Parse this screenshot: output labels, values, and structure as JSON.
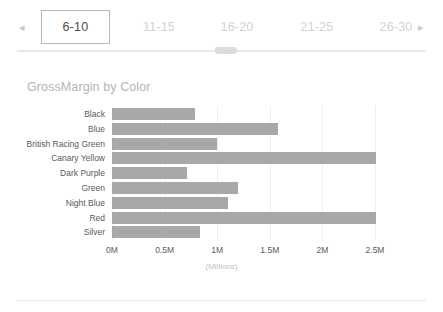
{
  "pager": {
    "prev_label": "◂",
    "next_label": "▸",
    "tabs": [
      {
        "label": "6-10",
        "active": true
      },
      {
        "label": "11-15",
        "active": false
      },
      {
        "label": "16-20",
        "active": false
      },
      {
        "label": "21-25",
        "active": false
      },
      {
        "label": "26-30",
        "active": false
      }
    ]
  },
  "chart_data": {
    "type": "bar",
    "orientation": "horizontal",
    "title": "GrossMargin by Color",
    "xlabel": "(Millions)",
    "ylabel": "",
    "categories": [
      "Black",
      "Blue",
      "British Racing Green",
      "Canary Yellow",
      "Dark Purple",
      "Green",
      "Night Blue",
      "Red",
      "Silver"
    ],
    "values": [
      0.79,
      1.58,
      1.0,
      2.51,
      0.71,
      1.2,
      1.1,
      2.51,
      0.84
    ],
    "value_unit": "Millions",
    "tick_labels": [
      "0M",
      "0.5M",
      "1M",
      "1.5M",
      "2M",
      "2.5M"
    ],
    "tick_values": [
      0,
      0.5,
      1,
      1.5,
      2,
      2.5
    ],
    "xlim": [
      0,
      2.6
    ],
    "grid": true,
    "legend": false,
    "bar_color": "#a8a8a8"
  }
}
